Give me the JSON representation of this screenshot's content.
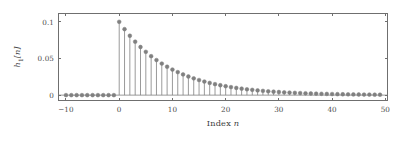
{
  "chart_data": {
    "type": "scatter",
    "plot_style": "stem",
    "title": "",
    "xlabel": "Index n",
    "ylabel": "h1[n]",
    "xlabel_text": "Index ",
    "xlabel_italic": "n",
    "ylabel_base": "h",
    "ylabel_sub": "1",
    "ylabel_tail": "[n]",
    "xlim": [
      -11.5,
      50.5
    ],
    "ylim": [
      -0.008,
      0.112
    ],
    "xticks": [
      -10,
      0,
      10,
      20,
      30,
      40,
      50
    ],
    "xticklabels": [
      "-10",
      "0",
      "10",
      "20",
      "30",
      "40",
      "50"
    ],
    "yticks": [
      0,
      0.05,
      0.1
    ],
    "yticklabels": [
      "0",
      "0.05",
      "0.1"
    ],
    "grid": false,
    "legend": null,
    "marker": "circle",
    "marker_color": "#808080",
    "stem_color": "#808080",
    "baseline_color": "#808080",
    "axis_color": "#6f6f6f",
    "background": "#ffffff",
    "x": [
      -10,
      -9,
      -8,
      -7,
      -6,
      -5,
      -4,
      -3,
      -2,
      -1,
      0,
      1,
      2,
      3,
      4,
      5,
      6,
      7,
      8,
      9,
      10,
      11,
      12,
      13,
      14,
      15,
      16,
      17,
      18,
      19,
      20,
      21,
      22,
      23,
      24,
      25,
      26,
      27,
      28,
      29,
      30,
      31,
      32,
      33,
      34,
      35,
      36,
      37,
      38,
      39,
      40,
      41,
      42,
      43,
      44,
      45,
      46,
      47,
      48,
      49
    ],
    "values": [
      0,
      0,
      0,
      0,
      0,
      0,
      0,
      0,
      0,
      0,
      0.1,
      0.09,
      0.081,
      0.0729,
      0.06561,
      0.059049,
      0.0531441,
      0.0478297,
      0.0430467,
      0.038742,
      0.0348678,
      0.031381,
      0.028243,
      0.0254187,
      0.0228768,
      0.0205891,
      0.0185302,
      0.0166772,
      0.0150095,
      0.0135085,
      0.0121577,
      0.0109419,
      0.0098477,
      0.0088629,
      0.0079766,
      0.007179,
      0.0064611,
      0.005815,
      0.0052335,
      0.0047101,
      0.0042391,
      0.0038152,
      0.0034337,
      0.0030903,
      0.0027813,
      0.0025032,
      0.0022528,
      0.0020276,
      0.0018248,
      0.0016423,
      0.0014781,
      0.0013303,
      0.0011972,
      0.0010775,
      0.0009698,
      0.0008728,
      0.0007855,
      0.000707,
      0.0006363,
      0.0005726
    ]
  }
}
